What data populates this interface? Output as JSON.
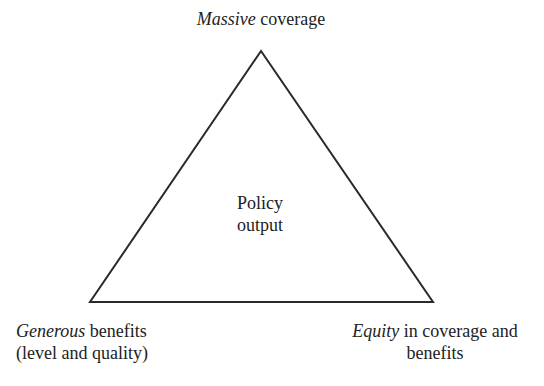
{
  "diagram": {
    "shape": "triangle",
    "stroke_color": "#2a2a2a",
    "vertices": {
      "top": {
        "x": 261,
        "y": 51
      },
      "bottom_left": {
        "x": 90,
        "y": 302
      },
      "bottom_right": {
        "x": 433,
        "y": 302
      }
    },
    "center": {
      "line1": "Policy",
      "line2": "output"
    },
    "top_vertex": {
      "italic": "Massive",
      "rest": " coverage"
    },
    "bottom_left_vertex": {
      "italic": "Generous",
      "rest": " benefits",
      "line2": "(level and quality)"
    },
    "bottom_right_vertex": {
      "italic": "Equity",
      "rest": " in coverage and",
      "line2": "benefits"
    }
  }
}
